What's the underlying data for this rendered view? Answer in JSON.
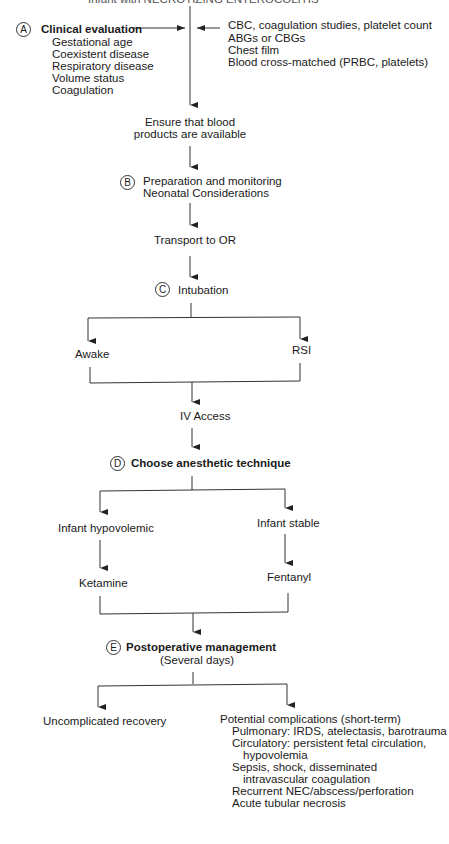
{
  "header": {
    "title_cut": "Infant with NECROTIZING ENTEROCOLITIS"
  },
  "steps": {
    "a": {
      "marker": "A",
      "title": "Clinical evaluation",
      "items": [
        "Gestational age",
        "Coexistent disease",
        "Respiratory disease",
        "Volume status",
        "Coagulation"
      ]
    },
    "labs": [
      "CBC, coagulation studies, platelet count",
      "ABGs or CBGs",
      "Chest film",
      "Blood cross-matched (PRBC, platelets)"
    ],
    "blood": [
      "Ensure that blood",
      "products are available"
    ],
    "b": {
      "marker": "B",
      "lines": [
        "Preparation and monitoring",
        "Neonatal Considerations"
      ]
    },
    "transport": "Transport to OR",
    "c": {
      "marker": "C",
      "title": "Intubation"
    },
    "awake": "Awake",
    "rsi": "RSI",
    "iv": "IV Access",
    "d": {
      "marker": "D",
      "title": "Choose anesthetic technique"
    },
    "hypo": "Infant hypovolemic",
    "stable": "Infant stable",
    "ketamine": "Ketamine",
    "fentanyl": "Fentanyl",
    "e": {
      "marker": "E",
      "title": "Postoperative management",
      "sub": "(Several days)"
    },
    "uncomplicated": "Uncomplicated recovery",
    "complications": {
      "title": "Potential complications (short-term)",
      "lines": [
        "Pulmonary: IRDS, atelectasis, barotrauma",
        "Circulatory: persistent fetal circulation,",
        "hypovolemia",
        "Sepsis, shock, disseminated",
        "intravascular coagulation",
        "Recurrent NEC/abscess/perforation",
        "Acute tubular necrosis"
      ]
    }
  }
}
